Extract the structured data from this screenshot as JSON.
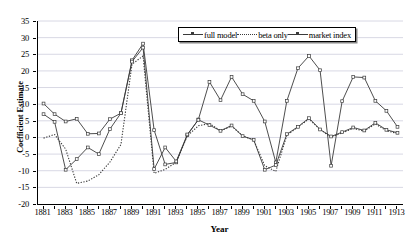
{
  "chart_data": {
    "type": "line",
    "title": "",
    "xlabel": "Year",
    "ylabel": "Coefficient Estimate",
    "xlim": [
      1880.5,
      1913.5
    ],
    "ylim": [
      -20,
      35
    ],
    "yticks": [
      -20,
      -15,
      -10,
      -5,
      0,
      5,
      10,
      15,
      20,
      25,
      30,
      35
    ],
    "ytick_labels": [
      "-20",
      "-15",
      "-10",
      "-5",
      "0",
      "5",
      "10",
      "15",
      "20",
      "25",
      "30",
      "35"
    ],
    "xticks": [
      1881,
      1883,
      1885,
      1887,
      1889,
      1891,
      1893,
      1895,
      1897,
      1899,
      1901,
      1903,
      1905,
      1907,
      1909,
      1911,
      1913
    ],
    "xtick_labels": [
      "1881",
      "1883",
      "1885",
      "1887",
      "1889",
      "1891",
      "1893",
      "1895",
      "1897",
      "1899",
      "1901",
      "1903",
      "1905",
      "1907",
      "1909",
      "1911",
      "1913"
    ],
    "x": [
      1881,
      1882,
      1883,
      1884,
      1885,
      1886,
      1887,
      1888,
      1889,
      1890,
      1891,
      1892,
      1893,
      1894,
      1895,
      1896,
      1897,
      1898,
      1899,
      1900,
      1901,
      1902,
      1903,
      1904,
      1905,
      1906,
      1907,
      1908,
      1909,
      1910,
      1911,
      1912,
      1913
    ],
    "grid": "horizontal",
    "legend_position": "top-center",
    "series": [
      {
        "name": "full model",
        "style": "solid",
        "marker": "square",
        "color": "#3a3a3a",
        "values": [
          10.2,
          7.0,
          4.8,
          5.6,
          1.1,
          1.2,
          5.5,
          7.3,
          23.2,
          28.2,
          2.2,
          -8.1,
          -7.5,
          0.7,
          5.4,
          16.7,
          11.2,
          18.2,
          13.0,
          11.0,
          4.8,
          -7.5,
          11.0,
          20.8,
          24.5,
          20.2,
          -8.5,
          10.9,
          18.2,
          18.0,
          11.0,
          8.0,
          3.2
        ]
      },
      {
        "name": "beta only",
        "style": "dotted",
        "marker": "none",
        "color": "#3a3a3a",
        "values": [
          -0.2,
          0.9,
          -3.5,
          -13.8,
          -13.1,
          -11.2,
          -7.4,
          -2.1,
          22.0,
          24.5,
          -10.8,
          -9.6,
          -7.4,
          0.5,
          3.5,
          4.2,
          2.0,
          3.4,
          0.5,
          -0.8,
          -8.5,
          -10.2,
          0.7,
          3.1,
          5.6,
          2.4,
          0.1,
          1.4,
          2.7,
          1.9,
          4.1,
          2.0,
          1.2
        ]
      },
      {
        "name": "market index",
        "style": "solid",
        "marker": "square",
        "color": "#3a3a3a",
        "values": [
          7.0,
          4.7,
          -9.7,
          -6.5,
          -3.0,
          -5.0,
          2.5,
          7.3,
          22.8,
          27.0,
          -9.5,
          -3.0,
          -7.2,
          0.9,
          5.3,
          3.7,
          2.0,
          3.6,
          0.4,
          -0.7,
          -9.7,
          -8.3,
          1.0,
          3.2,
          5.8,
          2.4,
          0.3,
          1.6,
          3.0,
          2.1,
          4.4,
          2.3,
          1.4
        ]
      }
    ]
  },
  "legend": {
    "items": [
      {
        "label": "full model"
      },
      {
        "label": "beta only"
      },
      {
        "label": "market index"
      }
    ]
  },
  "axes": {
    "x_title": "Year",
    "y_title": "Coefficient Estimate"
  },
  "colors": {
    "line": "#3a3a3a",
    "axis": "#000000",
    "grid": "#d8d8e4",
    "background": "#ffffff"
  }
}
